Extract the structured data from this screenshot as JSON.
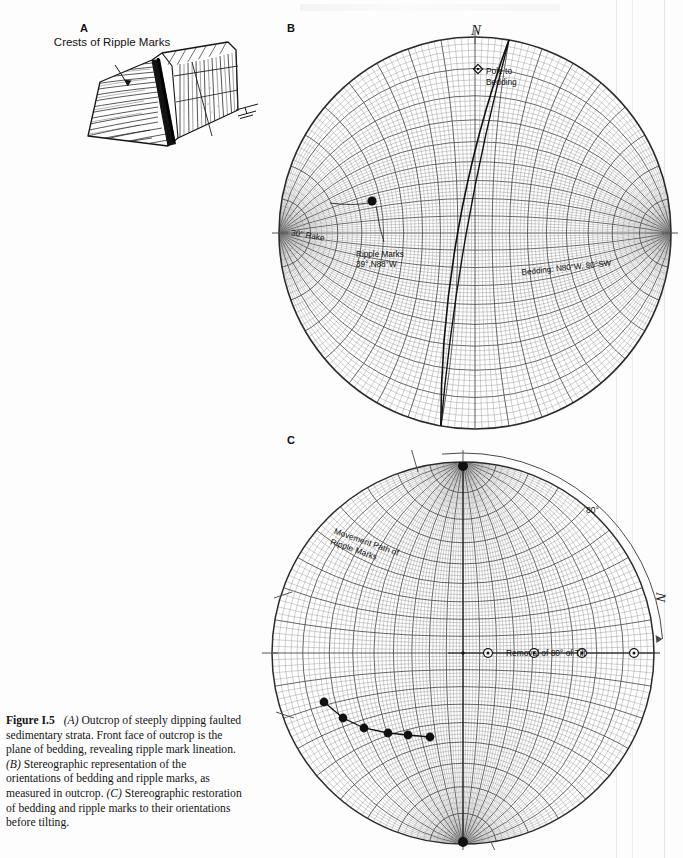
{
  "figure": {
    "number": "Figure I.5",
    "caption_parts": [
      {
        "italic": "(A)",
        "text": " Outcrop of steeply dipping faulted sedimentary strata. Front face of outcrop is the plane of bedding, revealing ripple mark lineation. "
      },
      {
        "italic": "(B)",
        "text": " Stereographic representation of the orientations of bedding and ripple marks, as measured in outcrop. "
      },
      {
        "italic": "(C)",
        "text": " Stereographic restoration of bedding and ripple marks to their orientations before tilting."
      }
    ],
    "caption_full": "Figure I.5   (A) Outcrop of steeply dipping faulted sedimentary strata. Front face of outcrop is the plane of bedding, revealing ripple mark lineation. (B) Stereographic representation of the orientations of bedding and ripple marks, as measured in outcrop. (C) Stereographic restoration of bedding and ripple marks to their orientations before tilting."
  },
  "panels": {
    "a": {
      "letter": "A",
      "annotation": "Crests of Ripple Marks",
      "icon": "outcrop-block-diagram",
      "strike_dip_symbol": "strike-dip-icon"
    },
    "b": {
      "letter": "B",
      "north_label": "N",
      "labels": {
        "pole_to_bedding": "Pole to\nBedding",
        "pole_to_bedding_line1": "Pole to",
        "pole_to_bedding_line2": "Bedding",
        "rake": "30° Rake",
        "ripple_line1": "Ripple Marks",
        "ripple_line2": "39°,N88°W",
        "bedding": "Bedding: N80°W, 80°SW"
      }
    },
    "c": {
      "letter": "C",
      "north_label": "N",
      "labels": {
        "movement_line1": "Movement Path of",
        "movement_line2": "Ripple Marks",
        "tilt_arc": "80°",
        "removal": "Removal of 80° of Tilt"
      }
    }
  },
  "chart_data": {
    "type": "scatter",
    "nets": [
      {
        "id": "B",
        "title": "Orientations as measured in outcrop",
        "net_type": "wulff-equal-angle",
        "grid_interval_deg": 2,
        "bold_grid_interval_deg": 10,
        "primitive_radius_px": 196,
        "center_px": [
          203,
          203
        ],
        "net_rotation_deg": 90,
        "planes": [
          {
            "name": "Bedding",
            "strike": "N80°W",
            "dip": 80,
            "dip_direction": "SW",
            "annotation": "Bedding: N80°W, 80°SW"
          },
          {
            "name": "Auxiliary great circle",
            "strike": "N80°W",
            "dip": 85
          }
        ],
        "lineations": [
          {
            "name": "Ripple Marks",
            "plunge": 39,
            "trend": "N88°W",
            "rake": 30,
            "annotation": "Ripple Marks 39°,N88°W",
            "marker": "filled-circle"
          }
        ],
        "poles": [
          {
            "name": "Pole to Bedding",
            "marker": "open-diamond"
          }
        ],
        "axis_labels": {
          "north": "N"
        }
      },
      {
        "id": "C",
        "title": "Restored orientations before tilting",
        "net_type": "wulff-equal-angle",
        "grid_interval_deg": 2,
        "bold_grid_interval_deg": 10,
        "primitive_radius_px": 191,
        "center_px": [
          201,
          203
        ],
        "net_rotation_deg": 0,
        "rotation_applied_deg": 80,
        "rotation_annotation": "Removal of 80° of Tilt",
        "path": {
          "name": "Movement Path of Ripple Marks",
          "marker": "filled-circle",
          "n_points": 6
        },
        "horizontal_track": {
          "name": "Removal of 80° of Tilt",
          "marker": "open-circle-with-dot",
          "n_points": 4
        },
        "arc_label": "80°",
        "axis_labels": {
          "north": "N"
        }
      }
    ]
  },
  "colors": {
    "page_background": "#fdfdfd",
    "ink": "#1a1a1a",
    "net_grid_fine": "#8d8d8d",
    "net_grid_bold": "#4a4a4a",
    "net_primitive": "#2b2b2b",
    "data_line": "#111111",
    "scan_edge": "#e9e9e9"
  }
}
